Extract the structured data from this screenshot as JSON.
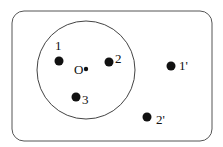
{
  "diagram": {
    "frame": {
      "x": 12,
      "y": 11,
      "width": 200,
      "height": 130,
      "rx": 12,
      "stroke": "#555555"
    },
    "circle": {
      "cx": 86,
      "cy": 70,
      "r": 49,
      "stroke": "#444444"
    },
    "center": {
      "label": "O",
      "x": 86,
      "y": 69,
      "r": 2.2,
      "label_x": 74,
      "label_y": 74
    },
    "points": [
      {
        "id": "1",
        "label": "1",
        "x": 59,
        "y": 61,
        "label_x": 55,
        "label_y": 50
      },
      {
        "id": "2",
        "label": "2",
        "x": 109,
        "y": 62,
        "label_x": 115,
        "label_y": 63
      },
      {
        "id": "3",
        "label": "3",
        "x": 76,
        "y": 97,
        "label_x": 82,
        "label_y": 104
      },
      {
        "id": "1prime",
        "label": "1'",
        "x": 171,
        "y": 66,
        "label_x": 179,
        "label_y": 70
      },
      {
        "id": "2prime",
        "label": "2'",
        "x": 147,
        "y": 117,
        "label_x": 156,
        "label_y": 124
      }
    ],
    "point_radius": 4.5,
    "point_color": "#111111"
  }
}
